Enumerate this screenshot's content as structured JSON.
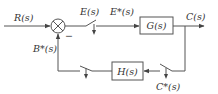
{
  "diagram": {
    "type": "sampled-data closed-loop control block diagram",
    "signals": {
      "input": "R(s)",
      "error": "E(s)",
      "sampled_error": "E*(s)",
      "output": "C(s)",
      "sampled_output": "C*(s)",
      "sampled_feedback": "B*(s)"
    },
    "blocks": {
      "forward": "G(s)",
      "feedback": "H(s)"
    },
    "summing_junction": {
      "feedback_sign": "−"
    },
    "samplers": [
      {
        "location": "after summing junction (E(s) → E*(s))"
      },
      {
        "location": "output feedback path (C(s) → C*(s))"
      },
      {
        "location": "after H(s) (→ B*(s))"
      }
    ],
    "colors": {
      "line": "#555555",
      "text": "#333333",
      "background": "#ffffff"
    }
  }
}
